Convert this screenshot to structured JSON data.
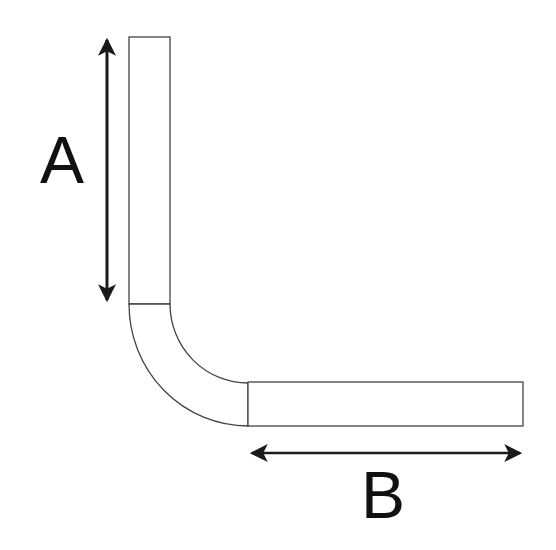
{
  "diagram": {
    "type": "bent-tube-dimension",
    "labels": {
      "a": "A",
      "b": "B"
    },
    "colors": {
      "stroke": "#444444",
      "arrow": "#1a1a1a",
      "text": "#111111",
      "background": "#ffffff"
    },
    "parts": [
      {
        "name": "vertical-leg",
        "dimension": "A"
      },
      {
        "name": "bend"
      },
      {
        "name": "horizontal-leg",
        "dimension": "B"
      }
    ]
  }
}
